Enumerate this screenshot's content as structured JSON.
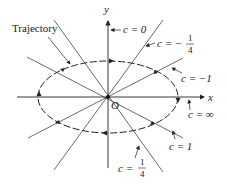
{
  "diagram": {
    "axes": {
      "x_label": "x",
      "y_label": "y",
      "origin_label": "O"
    },
    "trajectory_label": "Trajectory",
    "isoclines": [
      {
        "id": "c0",
        "label": "c = 0",
        "c": "0"
      },
      {
        "id": "cm14",
        "label_prefix": "c = −",
        "num": "1",
        "den": "4",
        "c": "-1/4"
      },
      {
        "id": "cm1",
        "label": "c = −1",
        "c": "-1"
      },
      {
        "id": "cinf",
        "label": "c = ∞",
        "c": "∞"
      },
      {
        "id": "c1",
        "label": "c = 1",
        "c": "1"
      },
      {
        "id": "c14",
        "label_prefix": "c = ",
        "num": "1",
        "den": "4",
        "c": "1/4"
      }
    ],
    "colors": {
      "line": "#333333",
      "background": "#ffffff"
    }
  }
}
